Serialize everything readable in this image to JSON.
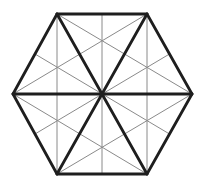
{
  "diagram": {
    "colors": {
      "background": "#ffffff",
      "thick_stroke": "#1e1e1e",
      "thin_stroke": "#8a8a8a"
    },
    "stroke_widths": {
      "thick": 2.8,
      "thin": 1
    },
    "vertices": {
      "A": [
        57,
        14
      ],
      "B": [
        147,
        14
      ],
      "C": [
        192,
        94
      ],
      "D": [
        147,
        174
      ],
      "E": [
        57,
        174
      ],
      "F": [
        13,
        94
      ],
      "O": [
        102,
        94
      ]
    },
    "thick_lines": [
      [
        "A",
        "B"
      ],
      [
        "B",
        "C"
      ],
      [
        "C",
        "D"
      ],
      [
        "D",
        "E"
      ],
      [
        "E",
        "F"
      ],
      [
        "F",
        "A"
      ],
      [
        "A",
        "D"
      ],
      [
        "B",
        "E"
      ],
      [
        "C",
        "F"
      ]
    ],
    "thin_lines": [
      [
        [
          57,
          14
        ],
        [
          57,
          174
        ]
      ],
      [
        [
          147,
          14
        ],
        [
          147,
          174
        ]
      ],
      [
        [
          102,
          14
        ],
        [
          102,
          174
        ]
      ],
      [
        [
          13,
          94
        ],
        [
          147,
          14
        ]
      ],
      [
        [
          13,
          94
        ],
        [
          147,
          174
        ]
      ],
      [
        [
          192,
          94
        ],
        [
          57,
          14
        ]
      ],
      [
        [
          192,
          94
        ],
        [
          57,
          174
        ]
      ],
      [
        [
          35,
          54
        ],
        [
          169.5,
          134
        ]
      ],
      [
        [
          169.5,
          54
        ],
        [
          35,
          134
        ]
      ]
    ]
  }
}
